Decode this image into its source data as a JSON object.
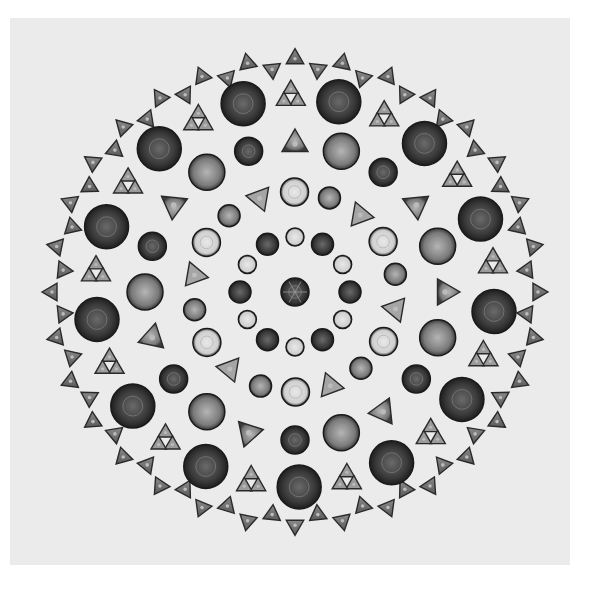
{
  "image": {
    "subject": "Circular arrangement of diatoms (micrograph)",
    "background_color": "#ebebeb",
    "page_color": "#ffffff",
    "arrangement": {
      "center": [
        295,
        292
      ],
      "outer_radius": 258,
      "rings": [
        {
          "type": "triangles",
          "radius": 238,
          "count": 64
        },
        {
          "type": "mixed-discs-triads",
          "radius": 200,
          "count": 26
        },
        {
          "type": "mixed",
          "radius": 150,
          "count": 22
        },
        {
          "type": "mixed",
          "radius": 100,
          "count": 18
        },
        {
          "type": "small-discs",
          "radius": 55,
          "count": 12
        }
      ]
    }
  }
}
